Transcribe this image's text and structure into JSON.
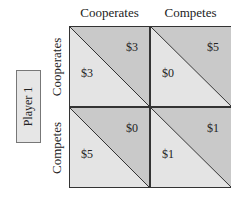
{
  "player1": {
    "label": "Player 1"
  },
  "columns": [
    {
      "label": "Cooperates"
    },
    {
      "label": "Competes"
    }
  ],
  "rows": [
    {
      "label": "Cooperates"
    },
    {
      "label": "Competes"
    }
  ],
  "cells": [
    [
      {
        "upper": "$3",
        "lower": "$3"
      },
      {
        "upper": "$5",
        "lower": "$0"
      }
    ],
    [
      {
        "upper": "$0",
        "lower": "$5"
      },
      {
        "upper": "$1",
        "lower": "$1"
      }
    ]
  ],
  "colors": {
    "upper_triangle": "#c9c9c9",
    "lower_triangle": "#e4e4e4",
    "lines": "#333333"
  }
}
